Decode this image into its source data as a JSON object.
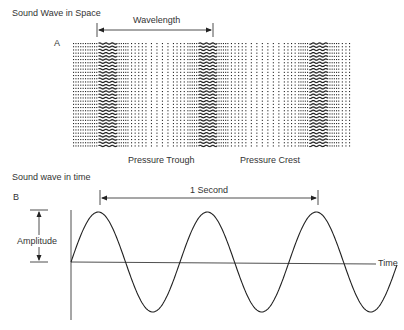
{
  "panel_a": {
    "title": "Sound Wave in Space",
    "letter": "A",
    "wavelength_label": "Wavelength",
    "trough_label": "Pressure Trough",
    "crest_label": "Pressure Crest"
  },
  "panel_b": {
    "title": "Sound wave in time",
    "letter": "B",
    "period_label": "1 Second",
    "amplitude_label": "Amplitude",
    "time_axis_label": "Time"
  },
  "colors": {
    "ink": "#222222",
    "background": "#ffffff"
  }
}
